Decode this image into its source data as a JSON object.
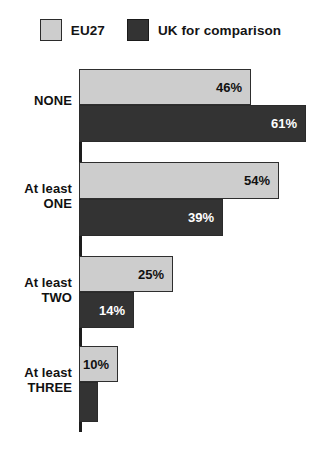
{
  "legend": {
    "entries": [
      {
        "label": "EU27",
        "color": "#cdcdcd",
        "swatch": "light-swatch"
      },
      {
        "label": "UK for comparison",
        "color": "#333333",
        "swatch": "dark-swatch"
      }
    ]
  },
  "chart_data": {
    "type": "bar",
    "orientation": "horizontal",
    "title": "",
    "subtitle": "",
    "xlabel": "",
    "ylabel": "",
    "xlim": [
      0,
      65
    ],
    "grid": false,
    "legend_position": "top-center",
    "categories": [
      "NONE",
      "At least ONE",
      "At least TWO",
      "At least THREE"
    ],
    "category_lines": [
      [
        "NONE"
      ],
      [
        "At least",
        "ONE"
      ],
      [
        "At least",
        "TWO"
      ],
      [
        "At least",
        "THREE"
      ]
    ],
    "series": [
      {
        "name": "EU27",
        "color": "#cdcdcd",
        "values": [
          46,
          54,
          25,
          10
        ],
        "labels": [
          "46%",
          "54%",
          "25%",
          "10%"
        ]
      },
      {
        "name": "UK for comparison",
        "color": "#333333",
        "values": [
          61,
          39,
          14,
          5
        ],
        "labels": [
          "61%",
          "39%",
          "14%",
          "5%"
        ]
      }
    ]
  },
  "groups": [
    {
      "name": "none",
      "label_lines": [
        "NONE"
      ],
      "label_top": 33,
      "top": 0,
      "bars": [
        {
          "series": "EU27",
          "style": "light",
          "value_label": "46%",
          "width": 172,
          "top": 9,
          "height": 36,
          "value_outside": false
        },
        {
          "series": "UK for comparison",
          "style": "dark",
          "value_label": "61%",
          "width": 227,
          "top": 45,
          "height": 37,
          "value_outside": false
        }
      ]
    },
    {
      "name": "at-least-one",
      "label_lines": [
        "At least",
        "ONE"
      ],
      "label_top": 121,
      "top": 0,
      "bars": [
        {
          "series": "EU27",
          "style": "light",
          "value_label": "54%",
          "width": 200,
          "top": 102,
          "height": 37,
          "value_outside": false
        },
        {
          "series": "UK for comparison",
          "style": "dark",
          "value_label": "39%",
          "width": 144,
          "top": 139,
          "height": 37,
          "value_outside": false
        }
      ]
    },
    {
      "name": "at-least-two",
      "label_lines": [
        "At least",
        "TWO"
      ],
      "label_top": 215,
      "top": 0,
      "bars": [
        {
          "series": "EU27",
          "style": "light",
          "value_label": "25%",
          "width": 94,
          "top": 196,
          "height": 36,
          "value_outside": false
        },
        {
          "series": "UK for comparison",
          "style": "dark",
          "value_label": "14%",
          "width": 55,
          "top": 232,
          "height": 36,
          "value_outside": false
        }
      ]
    },
    {
      "name": "at-least-three",
      "label_lines": [
        "At least",
        "THREE"
      ],
      "label_top": 305,
      "top": 0,
      "bars": [
        {
          "series": "EU27",
          "style": "light",
          "value_label": "10%",
          "width": 39,
          "top": 286,
          "height": 36,
          "value_outside": false
        },
        {
          "series": "UK for comparison",
          "style": "dark",
          "value_label": "5%",
          "width": 19,
          "top": 322,
          "height": 40,
          "value_outside": true
        }
      ]
    }
  ]
}
